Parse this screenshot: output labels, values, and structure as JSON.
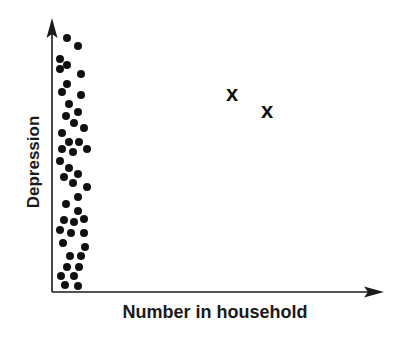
{
  "chart_data": {
    "type": "scatter",
    "title": "",
    "xlabel": "Number in household",
    "ylabel": "Depression",
    "ticks": false,
    "grid": false,
    "legend": null,
    "series": [
      {
        "name": "cluster",
        "marker": "dot",
        "points_px": [
          [
            67,
            38
          ],
          [
            78,
            46
          ],
          [
            60,
            59
          ],
          [
            67,
            65
          ],
          [
            60,
            69
          ],
          [
            81,
            74
          ],
          [
            67,
            84
          ],
          [
            62,
            92
          ],
          [
            81,
            95
          ],
          [
            69,
            104
          ],
          [
            78,
            112
          ],
          [
            66,
            116
          ],
          [
            74,
            123
          ],
          [
            84,
            128
          ],
          [
            62,
            133
          ],
          [
            69,
            142
          ],
          [
            79,
            142
          ],
          [
            62,
            149
          ],
          [
            73,
            152
          ],
          [
            87,
            149
          ],
          [
            60,
            161
          ],
          [
            69,
            168
          ],
          [
            64,
            177
          ],
          [
            78,
            174
          ],
          [
            73,
            183
          ],
          [
            87,
            187
          ],
          [
            78,
            197
          ],
          [
            66,
            204
          ],
          [
            78,
            211
          ],
          [
            64,
            220
          ],
          [
            74,
            222
          ],
          [
            84,
            219
          ],
          [
            60,
            230
          ],
          [
            71,
            233
          ],
          [
            84,
            233
          ],
          [
            63,
            243
          ],
          [
            85,
            247
          ],
          [
            70,
            256
          ],
          [
            81,
            256
          ],
          [
            67,
            267
          ],
          [
            79,
            267
          ],
          [
            61,
            276
          ],
          [
            74,
            276
          ],
          [
            65,
            285
          ],
          [
            78,
            286
          ]
        ]
      },
      {
        "name": "outliers",
        "marker": "x",
        "points_px": [
          [
            232,
            94
          ],
          [
            267,
            111
          ]
        ]
      }
    ],
    "axes": {
      "origin_px": [
        52,
        292
      ],
      "x_end_px": 383,
      "y_end_px": 18
    }
  },
  "labels": {
    "x_axis": "Number in household",
    "y_axis": "Depression",
    "marker_x": "x"
  }
}
